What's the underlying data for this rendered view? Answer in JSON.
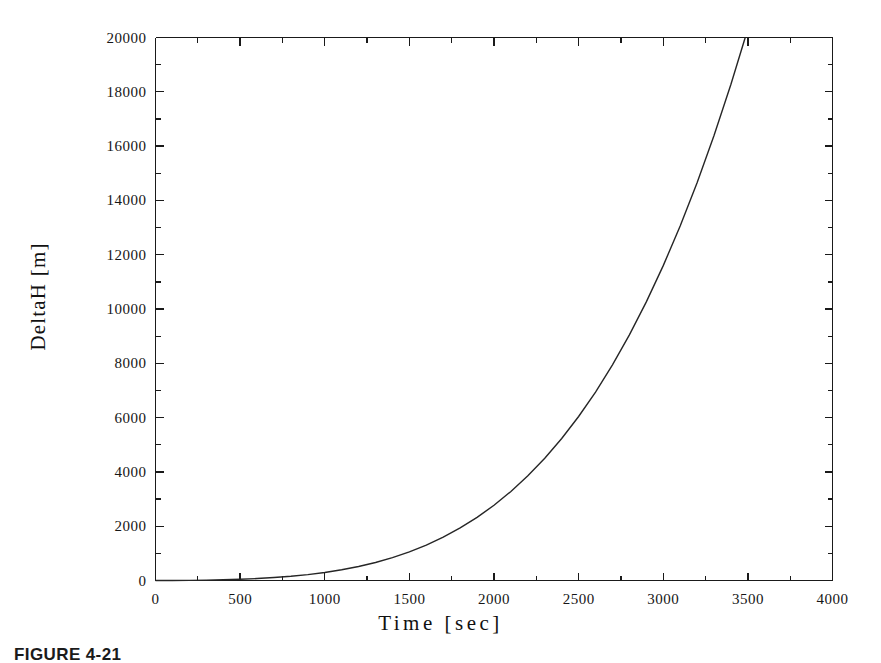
{
  "figure": {
    "caption": "FIGURE 4-21",
    "background_color": "#ffffff",
    "line_color": "#262626",
    "axis_color": "#1a1a1a"
  },
  "chart_data": {
    "type": "line",
    "title": "",
    "subtitle": "",
    "xlabel": "Time  [sec]",
    "ylabel": "DeltaH [m]",
    "xlim": [
      0,
      4000
    ],
    "ylim": [
      0,
      20000
    ],
    "grid": false,
    "legend": null,
    "xticks": [
      0,
      500,
      1000,
      1500,
      2000,
      2500,
      3000,
      3500,
      4000
    ],
    "xtick_labels": [
      "0",
      "500",
      "1000",
      "1500",
      "2000",
      "2500",
      "3000",
      "3500",
      "4000"
    ],
    "xminor_step": 250,
    "yticks": [
      0,
      2000,
      4000,
      6000,
      8000,
      10000,
      12000,
      14000,
      16000,
      18000,
      20000
    ],
    "ytick_labels": [
      "0",
      "2000",
      "4000",
      "6000",
      "8000",
      "10000",
      "12000",
      "14000",
      "16000",
      "18000",
      "20000"
    ],
    "yminor_step": 1000,
    "series": [
      {
        "name": "DeltaH",
        "x": [
          0,
          100,
          200,
          300,
          400,
          500,
          600,
          700,
          800,
          900,
          1000,
          1100,
          1200,
          1300,
          1400,
          1500,
          1600,
          1700,
          1800,
          1900,
          2000,
          2100,
          2200,
          2300,
          2400,
          2500,
          2600,
          2700,
          2800,
          2900,
          3000,
          3100,
          3200,
          3300,
          3400,
          3500,
          3600,
          3700,
          3800,
          3900,
          4000
        ],
        "y": [
          0,
          2,
          6,
          14,
          26,
          45,
          72,
          108,
          156,
          218,
          296,
          395,
          516,
          664,
          842,
          1054,
          1304,
          1596,
          1935,
          2325,
          2772,
          3280,
          3855,
          4503,
          5229,
          6040,
          6942,
          7942,
          9046,
          10262,
          11597,
          13058,
          14653,
          16390,
          18276,
          20320,
          22530,
          24915,
          27482,
          30241,
          33200
        ]
      }
    ]
  }
}
